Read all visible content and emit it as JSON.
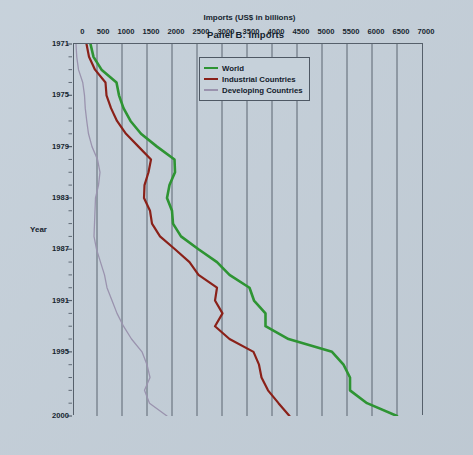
{
  "figure": {
    "title": "Panel B: Imports",
    "background_color": "#c4cfd9",
    "axis_color": "#56606b",
    "rotation_note": "90"
  },
  "legend": {
    "position": "upper-left",
    "items": [
      {
        "label": "World",
        "color": "#2e9433"
      },
      {
        "label": "Industrial Countries",
        "color": "#8a2119"
      },
      {
        "label": "Developing Countries",
        "color": "#9a93ae"
      }
    ]
  },
  "chart_data": {
    "type": "line",
    "title": "Panel B: Imports",
    "xlabel": "Year",
    "ylabel": "Imports (US$ in billions)",
    "xlim": [
      1971,
      2000
    ],
    "ylim": [
      0,
      7000
    ],
    "grid": true,
    "x_tick_labels": [
      "1971",
      "1975",
      "1979",
      "1983",
      "1987",
      "1991",
      "1995",
      "2000"
    ],
    "x_tick_values": [
      1971,
      1975,
      1979,
      1983,
      1987,
      1991,
      1995,
      2000
    ],
    "y_tick_labels": [
      "0",
      "500",
      "1000",
      "1500",
      "2000",
      "2500",
      "3000",
      "3500",
      "4000",
      "4500",
      "5000",
      "5500",
      "6000",
      "6500",
      "7000"
    ],
    "y_tick_values": [
      0,
      500,
      1000,
      1500,
      2000,
      2500,
      3000,
      3500,
      4000,
      4500,
      5000,
      5500,
      6000,
      6500,
      7000
    ],
    "x": [
      1971,
      1972,
      1973,
      1974,
      1975,
      1976,
      1977,
      1978,
      1979,
      1980,
      1981,
      1982,
      1983,
      1984,
      1985,
      1986,
      1987,
      1988,
      1989,
      1990,
      1991,
      1992,
      1993,
      1994,
      1995,
      1996,
      1997,
      1998,
      1999,
      2000
    ],
    "series": [
      {
        "name": "World",
        "color": "#2e9433",
        "values": [
          370,
          430,
          590,
          890,
          940,
          1030,
          1170,
          1380,
          1700,
          2050,
          2060,
          1950,
          1900,
          2000,
          2020,
          2180,
          2530,
          2900,
          3150,
          3550,
          3640,
          3870,
          3870,
          4330,
          5200,
          5430,
          5560,
          5560,
          5900,
          6500
        ]
      },
      {
        "name": "Industrial Countries",
        "color": "#8a2119",
        "values": [
          290,
          340,
          460,
          670,
          690,
          780,
          900,
          1080,
          1330,
          1580,
          1530,
          1450,
          1440,
          1560,
          1600,
          1760,
          2060,
          2350,
          2530,
          2900,
          2860,
          3010,
          2860,
          3150,
          3630,
          3740,
          3790,
          3920,
          4130,
          4350
        ]
      },
      {
        "name": "Developing Countries",
        "color": "#9a93ae",
        "values": [
          80,
          95,
          130,
          215,
          250,
          265,
          295,
          330,
          400,
          510,
          560,
          530,
          470,
          460,
          450,
          440,
          490,
          570,
          650,
          700,
          800,
          900,
          1030,
          1190,
          1400,
          1500,
          1560,
          1450,
          1550,
          1900
        ]
      }
    ]
  }
}
